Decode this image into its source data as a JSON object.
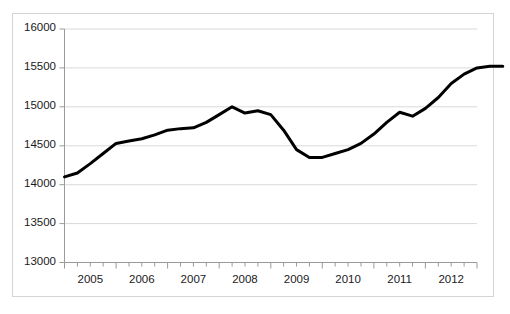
{
  "chart_data": {
    "type": "line",
    "title": "",
    "subtitle": "",
    "xlabel": "",
    "ylabel": "",
    "ylim": [
      13000,
      16000
    ],
    "ytick_labels": [
      "16000",
      "15500",
      "15000",
      "14500",
      "14000",
      "13500",
      "13000"
    ],
    "ytick_values": [
      16000,
      15500,
      15000,
      14500,
      14000,
      13500,
      13000
    ],
    "xtick_labels": [
      "2005",
      "2006",
      "2007",
      "2008",
      "2009",
      "2010",
      "2011",
      "2012"
    ],
    "x_minor_ticks_per_label": 4,
    "grid": true,
    "grid_axis": "y",
    "legend": "none",
    "series": [
      {
        "name": "series-1",
        "color": "#000000",
        "line_width": 3,
        "x": [
          "2005 Q1",
          "2005 Q2",
          "2005 Q3",
          "2005 Q4",
          "2006 Q1",
          "2006 Q2",
          "2006 Q3",
          "2006 Q4",
          "2007 Q1",
          "2007 Q2",
          "2007 Q3",
          "2007 Q4",
          "2008 Q1",
          "2008 Q2",
          "2008 Q3",
          "2008 Q4",
          "2009 Q1",
          "2009 Q2",
          "2009 Q3",
          "2009 Q4",
          "2010 Q1",
          "2010 Q2",
          "2010 Q3",
          "2010 Q4",
          "2011 Q1",
          "2011 Q2",
          "2011 Q3",
          "2011 Q4",
          "2012 Q1",
          "2012 Q2",
          "2012 Q3",
          "2012 Q4"
        ],
        "values": [
          14100,
          14150,
          14270,
          14400,
          14530,
          14560,
          14590,
          14640,
          14700,
          14720,
          14730,
          14800,
          14900,
          15000,
          14920,
          14950,
          14900,
          14700,
          14450,
          14350,
          14350,
          14400,
          14450,
          14530,
          14650,
          14800,
          14930,
          14880,
          14980,
          15120,
          15300,
          15420
        ]
      }
    ],
    "values_tail": [
      15500,
      15520,
      15520
    ]
  },
  "axes": {
    "y_axis_name": "value-axis",
    "x_axis_name": "time-axis"
  }
}
